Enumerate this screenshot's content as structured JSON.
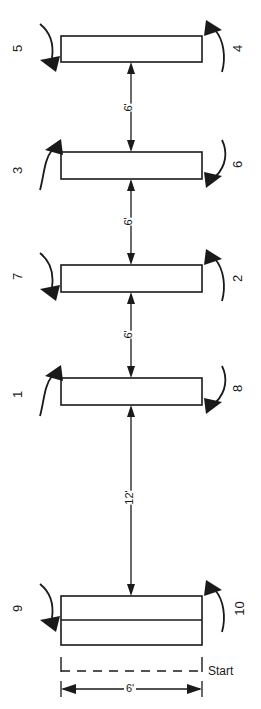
{
  "diagram": {
    "type": "line-diagram",
    "units": "feet",
    "ink_color": "#1a1a1a",
    "background_color": "#ffffff",
    "rows": [
      {
        "index": 1,
        "bar_name": "stripe-bar-1",
        "left_marker": "5",
        "left_marker_direction": "down",
        "right_marker": "4",
        "right_marker_direction": "up"
      },
      {
        "index": 2,
        "bar_name": "stripe-bar-2",
        "left_marker": "3",
        "left_marker_direction": "up",
        "right_marker": "6",
        "right_marker_direction": "down"
      },
      {
        "index": 3,
        "bar_name": "stripe-bar-3",
        "left_marker": "7",
        "left_marker_direction": "down",
        "right_marker": "2",
        "right_marker_direction": "up"
      },
      {
        "index": 4,
        "bar_name": "stripe-bar-4",
        "left_marker": "1",
        "left_marker_direction": "up",
        "right_marker": "8",
        "right_marker_direction": "down"
      },
      {
        "index": 5,
        "bar_name": "start-block",
        "left_marker": "9",
        "left_marker_direction": "down",
        "right_marker": "10",
        "right_marker_direction": "up"
      }
    ],
    "spacings": [
      {
        "name": "gap-1-2",
        "label": "6'",
        "value": 6
      },
      {
        "name": "gap-2-3",
        "label": "6'",
        "value": 6
      },
      {
        "name": "gap-3-4",
        "label": "6'",
        "value": 6
      },
      {
        "name": "gap-4-start",
        "label": "12'",
        "value": 12
      }
    ],
    "width_dimension": {
      "label": "6'",
      "value": 6
    },
    "start_label": "Start"
  }
}
